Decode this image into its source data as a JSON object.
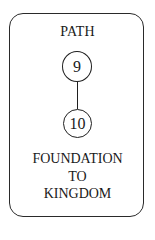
{
  "card": {
    "title": "PATH",
    "nodes": [
      {
        "label": "9"
      },
      {
        "label": "10"
      }
    ],
    "caption_lines": [
      "FOUNDATION",
      "TO",
      "KINGDOM"
    ]
  },
  "colors": {
    "stroke": "#1f1f1f",
    "background": "#ffffff",
    "text": "#1a1a1a"
  }
}
